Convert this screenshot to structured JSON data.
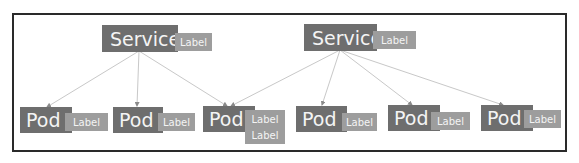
{
  "diagram": {
    "colors": {
      "node_fill": "#6e6e6e",
      "label_fill": "#9d9d9d",
      "line": "#c8c8c8",
      "frame": "#2a2a2a",
      "text": "#f4f4f4"
    },
    "services": [
      {
        "name": "Service",
        "labels": [
          "Label"
        ]
      },
      {
        "name": "Service",
        "labels": [
          "Label"
        ]
      }
    ],
    "pods": [
      {
        "name": "Pod",
        "labels": [
          "Label"
        ]
      },
      {
        "name": "Pod",
        "labels": [
          "Label"
        ]
      },
      {
        "name": "Pod",
        "labels": [
          "Label",
          "Label"
        ]
      },
      {
        "name": "Pod",
        "labels": [
          "Label"
        ]
      },
      {
        "name": "Pod",
        "labels": [
          "Label"
        ]
      },
      {
        "name": "Pod",
        "labels": [
          "Label"
        ]
      }
    ],
    "edges": [
      {
        "from": "service-1",
        "to": "pod-1"
      },
      {
        "from": "service-1",
        "to": "pod-2"
      },
      {
        "from": "service-1",
        "to": "pod-3"
      },
      {
        "from": "service-2",
        "to": "pod-3"
      },
      {
        "from": "service-2",
        "to": "pod-4"
      },
      {
        "from": "service-2",
        "to": "pod-5"
      },
      {
        "from": "service-2",
        "to": "pod-6"
      }
    ]
  }
}
